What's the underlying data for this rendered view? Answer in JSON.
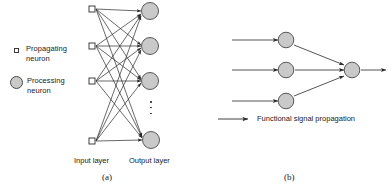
{
  "figure": {
    "legend": {
      "propagating": {
        "icon": "square-marker-icon",
        "label": "Propagating\nneuron"
      },
      "processing": {
        "icon": "circle-marker-icon",
        "label": "Processing\nneuron"
      }
    },
    "panel_a": {
      "caption": "(a)",
      "input_layer_label": "Input layer",
      "output_layer_label": "Output layer",
      "ellipsis_glyph": "vertical-ellipsis-icon",
      "input_node_count": 4,
      "output_node_count": 4,
      "connectivity": "fully-connected"
    },
    "panel_b": {
      "caption": "(b)",
      "legend_arrow_label": "Functional signal propagation",
      "input_node_count": 3,
      "output_node_count": 1
    },
    "colors": {
      "node_fill": "#c9c9c9",
      "node_stroke": "#4a4a4a",
      "line": "#2a2a2a",
      "text": "#1a1a1a",
      "background": "#ffffff"
    }
  }
}
